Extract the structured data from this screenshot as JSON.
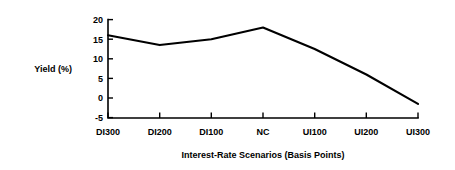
{
  "chart_data": {
    "type": "line",
    "title": "",
    "subtitle": "",
    "xlabel": "Interest-Rate Scenarios (Basis Points)",
    "ylabel": "Yield (%)",
    "categories": [
      "DI300",
      "DI200",
      "DI100",
      "NC",
      "UI100",
      "UI200",
      "UI300"
    ],
    "values": [
      16,
      13.5,
      15,
      18,
      12.5,
      6,
      -1.5
    ],
    "series": [
      {
        "name": "Yield",
        "values": [
          16,
          13.5,
          15,
          18,
          12.5,
          6,
          -1.5
        ]
      }
    ],
    "ylim": [
      -5,
      20
    ],
    "yticks": [
      -5,
      0,
      5,
      10,
      15,
      20
    ],
    "ytick_labels": [
      "-5",
      "0",
      "5",
      "10",
      "15",
      "20"
    ],
    "grid": false,
    "legend": "none",
    "line_color": "#000000",
    "background_color": "#ffffff",
    "axis_color": "#000000"
  }
}
